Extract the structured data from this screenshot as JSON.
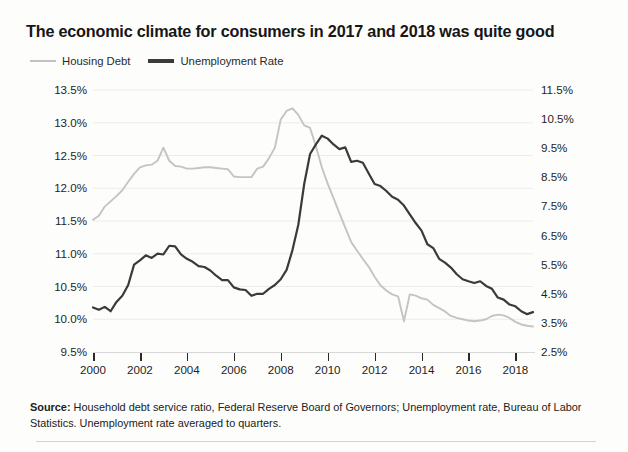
{
  "title": "The economic climate for consumers in 2017 and 2018 was quite good",
  "legend": [
    {
      "label": "Housing Debt",
      "color": "#c4c4c4",
      "style": "thin"
    },
    {
      "label": "Unemployment Rate",
      "color": "#3a3a3a",
      "style": "thick"
    }
  ],
  "source": {
    "prefix": "Source:",
    "text": " Household debt service ratio, Federal Reserve Board of Governors; Unemployment rate, Bureau of Labor Statistics. Unemployment rate averaged to quarters."
  },
  "chart_data": {
    "type": "line",
    "title": "The economic climate for consumers in 2017 and 2018 was quite good",
    "xlabel": "",
    "ylabel": "",
    "grid": true,
    "legend_position": "top-left",
    "x_ticks": [
      "2000",
      "2002",
      "2004",
      "2006",
      "2008",
      "2010",
      "2012",
      "2014",
      "2016",
      "2018"
    ],
    "x": [
      2000,
      2000.25,
      2000.5,
      2000.75,
      2001,
      2001.25,
      2001.5,
      2001.75,
      2002,
      2002.25,
      2002.5,
      2002.75,
      2003,
      2003.25,
      2003.5,
      2003.75,
      2004,
      2004.25,
      2004.5,
      2004.75,
      2005,
      2005.25,
      2005.5,
      2005.75,
      2006,
      2006.25,
      2006.5,
      2006.75,
      2007,
      2007.25,
      2007.5,
      2007.75,
      2008,
      2008.25,
      2008.5,
      2008.75,
      2009,
      2009.25,
      2009.5,
      2009.75,
      2010,
      2010.25,
      2010.5,
      2010.75,
      2011,
      2011.25,
      2011.5,
      2011.75,
      2012,
      2012.25,
      2012.5,
      2012.75,
      2013,
      2013.25,
      2013.5,
      2013.75,
      2014,
      2014.25,
      2014.5,
      2014.75,
      2015,
      2015.25,
      2015.5,
      2015.75,
      2016,
      2016.25,
      2016.5,
      2016.75,
      2017,
      2017.25,
      2017.5,
      2017.75,
      2018,
      2018.25,
      2018.5,
      2018.75
    ],
    "xlim": [
      2000,
      2018.75
    ],
    "axes": [
      {
        "id": "left",
        "side": "left",
        "series": "Housing Debt",
        "ylim": [
          9.5,
          13.5
        ],
        "ticks": [
          "9.5%",
          "10.0%",
          "10.5%",
          "11.0%",
          "11.5%",
          "12.0%",
          "12.5%",
          "13.0%",
          "13.5%"
        ],
        "tick_values": [
          9.5,
          10.0,
          10.5,
          11.0,
          11.5,
          12.0,
          12.5,
          13.0,
          13.5
        ]
      },
      {
        "id": "right",
        "side": "right",
        "series": "Unemployment Rate",
        "ylim": [
          2.5,
          11.5
        ],
        "ticks": [
          "2.5%",
          "3.5%",
          "4.5%",
          "5.5%",
          "6.5%",
          "7.5%",
          "8.5%",
          "9.5%",
          "10.5%",
          "11.5%"
        ],
        "tick_values": [
          2.5,
          3.5,
          4.5,
          5.5,
          6.5,
          7.5,
          8.5,
          9.5,
          10.5,
          11.5
        ]
      }
    ],
    "series": [
      {
        "name": "Housing Debt",
        "axis": "left",
        "color": "#c4c4c4",
        "units": "percent",
        "values": [
          11.52,
          11.58,
          11.72,
          11.8,
          11.88,
          11.97,
          12.1,
          12.22,
          12.32,
          12.35,
          12.36,
          12.42,
          12.62,
          12.42,
          12.34,
          12.33,
          12.3,
          12.3,
          12.31,
          12.32,
          12.32,
          12.31,
          12.3,
          12.29,
          12.18,
          12.17,
          12.17,
          12.17,
          12.3,
          12.33,
          12.46,
          12.62,
          13.05,
          13.18,
          13.22,
          13.12,
          12.96,
          12.92,
          12.64,
          12.32,
          12.07,
          11.85,
          11.62,
          11.4,
          11.18,
          11.05,
          10.92,
          10.8,
          10.65,
          10.52,
          10.44,
          10.38,
          10.35,
          9.97,
          10.38,
          10.36,
          10.32,
          10.3,
          10.22,
          10.17,
          10.12,
          10.05,
          10.02,
          10.0,
          9.98,
          9.97,
          9.98,
          10.0,
          10.05,
          10.07,
          10.06,
          10.02,
          9.96,
          9.92,
          9.9,
          9.89
        ]
      },
      {
        "name": "Unemployment Rate",
        "axis": "right",
        "color": "#3a3a3a",
        "units": "percent",
        "values": [
          4.03,
          3.95,
          4.05,
          3.9,
          4.22,
          4.43,
          4.8,
          5.5,
          5.65,
          5.82,
          5.73,
          5.88,
          5.85,
          6.15,
          6.13,
          5.85,
          5.7,
          5.6,
          5.45,
          5.42,
          5.3,
          5.12,
          4.97,
          4.97,
          4.72,
          4.65,
          4.63,
          4.43,
          4.5,
          4.5,
          4.67,
          4.8,
          5.0,
          5.32,
          6.0,
          6.87,
          8.27,
          9.3,
          9.63,
          9.93,
          9.83,
          9.63,
          9.47,
          9.53,
          9.03,
          9.07,
          9.0,
          8.63,
          8.27,
          8.2,
          8.03,
          7.83,
          7.73,
          7.53,
          7.23,
          6.93,
          6.67,
          6.2,
          6.07,
          5.7,
          5.57,
          5.4,
          5.17,
          5.0,
          4.93,
          4.87,
          4.93,
          4.77,
          4.67,
          4.37,
          4.3,
          4.13,
          4.07,
          3.9,
          3.8,
          3.87
        ]
      }
    ]
  }
}
